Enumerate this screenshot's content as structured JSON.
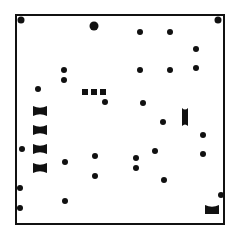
{
  "board": {
    "left": 15,
    "top": 14,
    "width": 206,
    "height": 207,
    "border_color": "#111111",
    "background": "#ffffff"
  },
  "pieces": {
    "dots": [
      {
        "x": 21,
        "y": 20,
        "r": 3.5
      },
      {
        "x": 94,
        "y": 26,
        "r": 4.5
      },
      {
        "x": 218,
        "y": 20,
        "r": 3.5
      },
      {
        "x": 140,
        "y": 32,
        "r": 3
      },
      {
        "x": 170,
        "y": 32,
        "r": 3
      },
      {
        "x": 196,
        "y": 49,
        "r": 3
      },
      {
        "x": 64,
        "y": 70,
        "r": 3
      },
      {
        "x": 64,
        "y": 80,
        "r": 3
      },
      {
        "x": 140,
        "y": 70,
        "r": 3
      },
      {
        "x": 170,
        "y": 70,
        "r": 3
      },
      {
        "x": 196,
        "y": 68,
        "r": 3
      },
      {
        "x": 38,
        "y": 89,
        "r": 3
      },
      {
        "x": 105,
        "y": 102,
        "r": 3
      },
      {
        "x": 143,
        "y": 103,
        "r": 3
      },
      {
        "x": 163,
        "y": 122,
        "r": 3
      },
      {
        "x": 203,
        "y": 135,
        "r": 3
      },
      {
        "x": 203,
        "y": 154,
        "r": 3
      },
      {
        "x": 22,
        "y": 149,
        "r": 3
      },
      {
        "x": 65,
        "y": 162,
        "r": 3
      },
      {
        "x": 95,
        "y": 156,
        "r": 3
      },
      {
        "x": 95,
        "y": 176,
        "r": 3
      },
      {
        "x": 155,
        "y": 151,
        "r": 3
      },
      {
        "x": 136,
        "y": 158,
        "r": 3
      },
      {
        "x": 136,
        "y": 168,
        "r": 3
      },
      {
        "x": 164,
        "y": 180,
        "r": 3
      },
      {
        "x": 20,
        "y": 188,
        "r": 3
      },
      {
        "x": 65,
        "y": 201,
        "r": 3
      },
      {
        "x": 20,
        "y": 208,
        "r": 3
      },
      {
        "x": 221,
        "y": 195,
        "r": 3
      }
    ],
    "squares": [
      {
        "x": 85,
        "y": 92,
        "size": 6
      },
      {
        "x": 94,
        "y": 92,
        "size": 6
      },
      {
        "x": 103,
        "y": 92,
        "size": 6
      }
    ],
    "horizontal_capsules": [
      {
        "x": 40,
        "y": 111,
        "w": 14,
        "h": 10
      },
      {
        "x": 40,
        "y": 130,
        "w": 14,
        "h": 10
      },
      {
        "x": 40,
        "y": 149,
        "w": 14,
        "h": 10
      },
      {
        "x": 40,
        "y": 168,
        "w": 14,
        "h": 10
      }
    ],
    "vertical_capsules": [
      {
        "x": 185,
        "y": 117,
        "w": 6,
        "h": 18
      }
    ],
    "trays": [
      {
        "x": 212,
        "y": 209,
        "w": 14,
        "h": 9
      }
    ]
  }
}
